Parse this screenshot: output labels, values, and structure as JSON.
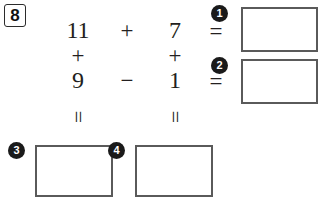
{
  "worksheet": {
    "problem_number": "8",
    "type": "arithmetic-cross-grid"
  },
  "grid": {
    "row1": {
      "left_operand": "11",
      "operator": "+",
      "right_operand": "7",
      "equals": "="
    },
    "column_operators": {
      "left": "+",
      "right": "+"
    },
    "row3": {
      "left_operand": "9",
      "operator": "−",
      "right_operand": "1",
      "equals": "="
    },
    "row2_equals_right": "=",
    "bottom_equals": {
      "left": "=",
      "right": "="
    }
  },
  "answer_boxes": [
    {
      "label": "1",
      "value": "",
      "position": "row1-result"
    },
    {
      "label": "2",
      "value": "",
      "position": "row3-result"
    },
    {
      "label": "3",
      "value": "",
      "position": "column1-result"
    },
    {
      "label": "4",
      "value": "",
      "position": "column2-result"
    }
  ],
  "colors": {
    "ink": "#231f20",
    "box_border": "#5a5a5a",
    "badge_fill": "#1a1a1a",
    "badge_text": "#ffffff",
    "page": "#ffffff"
  }
}
